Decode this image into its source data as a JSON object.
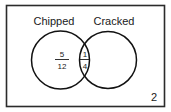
{
  "diagram": {
    "type": "venn-diagram",
    "title": "",
    "universe": {
      "outside_value": "2"
    },
    "sets": [
      {
        "id": "chipped",
        "label": "Chipped",
        "region_value": "5/12",
        "numerator": "5",
        "denominator": "12"
      },
      {
        "id": "cracked",
        "label": "Cracked",
        "region_value": "",
        "numerator": "",
        "denominator": ""
      }
    ],
    "intersection": {
      "label": "",
      "region_value": "1/4",
      "numerator": "1",
      "denominator": "4"
    },
    "colors": {
      "background": "#ffffff",
      "border": "#2b2b2b",
      "circle_stroke": "#111111",
      "text": "#1a1a1a"
    }
  }
}
